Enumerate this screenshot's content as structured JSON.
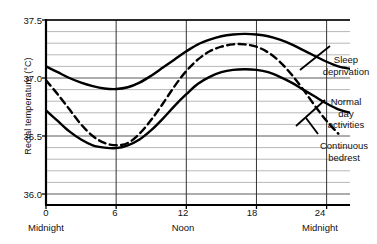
{
  "chart_data": {
    "type": "line",
    "title": "",
    "xlabel": "",
    "ylabel": "Rectal temperature (°C)",
    "xlim": [
      0,
      26
    ],
    "ylim": [
      36.0,
      37.55
    ],
    "grid": true,
    "grid_major_step": 0.5,
    "grid_minor_step": 0.1,
    "legend_position": "right",
    "x_tick_values": [
      "0",
      "6",
      "12",
      "18",
      "24"
    ],
    "x_tick_captions": [
      "Midnight",
      "",
      "Noon",
      "",
      "Midnight"
    ],
    "y_tick_values": [
      "37.5",
      "37.0",
      "36.5",
      "36.0"
    ],
    "series": [
      {
        "name": "Sleep deprivation",
        "style": "solid",
        "x": [
          0,
          1,
          2,
          3,
          4,
          5,
          6,
          7,
          8,
          9,
          10,
          11,
          12,
          13,
          14,
          15,
          16,
          17,
          18,
          19,
          20,
          21,
          22,
          23,
          24,
          25,
          26
        ],
        "values": [
          37.1,
          37.05,
          37.0,
          36.96,
          36.93,
          36.91,
          36.905,
          36.92,
          36.96,
          37.02,
          37.09,
          37.16,
          37.23,
          37.29,
          37.33,
          37.36,
          37.375,
          37.38,
          37.375,
          37.36,
          37.33,
          37.29,
          37.24,
          37.19,
          37.14,
          37.1,
          37.08
        ]
      },
      {
        "name": "Normal day activities",
        "style": "dashed",
        "x": [
          0,
          1,
          2,
          3,
          4,
          5,
          6,
          7,
          8,
          9,
          10,
          11,
          12,
          13,
          14,
          15,
          16,
          17,
          18,
          19,
          20,
          21,
          22,
          23,
          24,
          25
        ],
        "values": [
          36.98,
          36.86,
          36.73,
          36.6,
          36.5,
          36.44,
          36.42,
          36.44,
          36.52,
          36.64,
          36.78,
          36.93,
          37.06,
          37.16,
          37.23,
          37.27,
          37.29,
          37.29,
          37.27,
          37.22,
          37.14,
          37.03,
          36.9,
          36.76,
          36.63,
          36.52
        ]
      },
      {
        "name": "Continuous bedrest",
        "style": "solid",
        "x": [
          0,
          1,
          2,
          3,
          4,
          5,
          6,
          7,
          8,
          9,
          10,
          11,
          12,
          13,
          14,
          15,
          16,
          17,
          18,
          19,
          20,
          21,
          22,
          23,
          24,
          25,
          26
        ],
        "values": [
          36.72,
          36.63,
          36.54,
          36.47,
          36.42,
          36.4,
          36.395,
          36.42,
          36.47,
          36.55,
          36.65,
          36.76,
          36.86,
          36.95,
          37.01,
          37.05,
          37.07,
          37.075,
          37.07,
          37.05,
          37.01,
          36.96,
          36.9,
          36.84,
          36.78,
          36.73,
          36.7
        ]
      }
    ],
    "annotations": [
      {
        "text": "Sleep\ndeprivation",
        "target_series": "Sleep deprivation"
      },
      {
        "text": "Normal\nday\nactivities",
        "target_series": "Normal day activities"
      },
      {
        "text": "Continuous\nbedrest",
        "target_series": "Continuous bedrest"
      }
    ],
    "colors": {
      "line": "#000000",
      "grid_major": "#5a5a5a",
      "grid_minor": "#9a9a9a",
      "axis": "#000000",
      "background": "#ffffff"
    }
  }
}
